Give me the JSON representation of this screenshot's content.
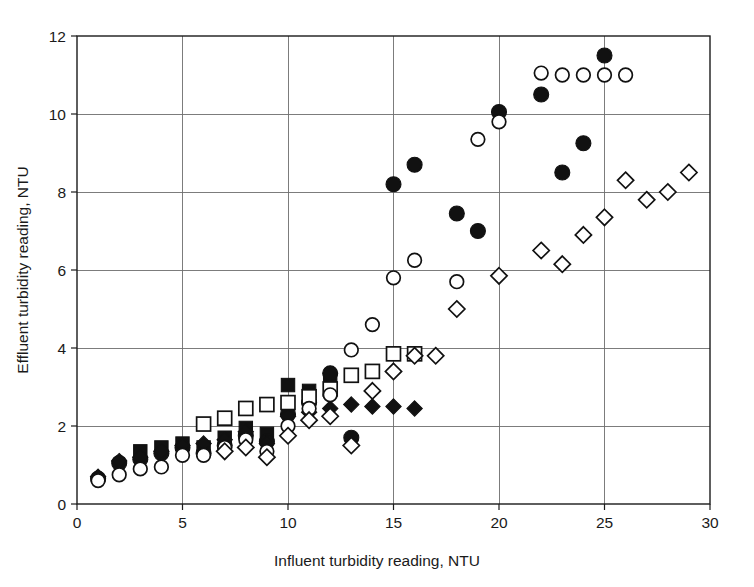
{
  "chart_data": {
    "type": "scatter",
    "title": "",
    "xlabel": "Influent turbidity reading, NTU",
    "ylabel": "Effluent turbidity reading, NTU",
    "xlim": [
      0,
      30
    ],
    "ylim": [
      0,
      12
    ],
    "xticks": [
      0,
      5,
      10,
      15,
      20,
      25,
      30
    ],
    "yticks": [
      0,
      2,
      4,
      6,
      8,
      10,
      12
    ],
    "xtick_labels": [
      "0",
      "5",
      "10",
      "15",
      "20",
      "25",
      "30"
    ],
    "ytick_labels": [
      "0",
      "2",
      "4",
      "6",
      "8",
      "10",
      "12"
    ],
    "grid": true,
    "grid_color": "#6e6e6e",
    "legend": "none",
    "marker_color": "#111111",
    "series": [
      {
        "name": "filled-circle",
        "marker": "filled-circle",
        "points": [
          [
            1,
            0.65
          ],
          [
            2,
            1.05
          ],
          [
            3,
            1.15
          ],
          [
            4,
            1.3
          ],
          [
            5,
            1.45
          ],
          [
            6,
            1.3
          ],
          [
            7,
            1.5
          ],
          [
            8,
            1.75
          ],
          [
            9,
            1.6
          ],
          [
            10,
            2.3
          ],
          [
            11,
            2.6
          ],
          [
            12,
            3.35
          ],
          [
            13,
            1.7
          ],
          [
            15,
            8.2
          ],
          [
            16,
            8.7
          ],
          [
            18,
            7.45
          ],
          [
            19,
            7.0
          ],
          [
            20,
            10.05
          ],
          [
            22,
            10.5
          ],
          [
            23,
            8.5
          ],
          [
            24,
            9.25
          ],
          [
            25,
            11.5
          ]
        ]
      },
      {
        "name": "open-circle",
        "marker": "open-circle",
        "points": [
          [
            1,
            0.6
          ],
          [
            2,
            0.75
          ],
          [
            3,
            0.9
          ],
          [
            4,
            0.95
          ],
          [
            5,
            1.25
          ],
          [
            6,
            1.25
          ],
          [
            7,
            1.45
          ],
          [
            8,
            1.65
          ],
          [
            9,
            1.35
          ],
          [
            10,
            2.0
          ],
          [
            11,
            2.45
          ],
          [
            12,
            2.8
          ],
          [
            13,
            3.95
          ],
          [
            14,
            4.6
          ],
          [
            15,
            5.8
          ],
          [
            16,
            6.25
          ],
          [
            18,
            5.7
          ],
          [
            19,
            9.35
          ],
          [
            20,
            9.8
          ],
          [
            22,
            11.05
          ],
          [
            23,
            11.0
          ],
          [
            24,
            11.0
          ],
          [
            25,
            11.0
          ],
          [
            26,
            11.0
          ]
        ]
      },
      {
        "name": "filled-square",
        "marker": "filled-square",
        "points": [
          [
            3,
            1.35
          ],
          [
            4,
            1.45
          ],
          [
            5,
            1.55
          ],
          [
            6,
            1.45
          ],
          [
            7,
            1.7
          ],
          [
            8,
            1.95
          ],
          [
            9,
            1.8
          ],
          [
            10,
            3.05
          ],
          [
            11,
            2.9
          ],
          [
            12,
            3.2
          ]
        ]
      },
      {
        "name": "open-square",
        "marker": "open-square",
        "points": [
          [
            6,
            2.05
          ],
          [
            7,
            2.2
          ],
          [
            8,
            2.45
          ],
          [
            9,
            2.55
          ],
          [
            10,
            2.6
          ],
          [
            11,
            2.75
          ],
          [
            12,
            2.95
          ],
          [
            13,
            3.3
          ],
          [
            14,
            3.4
          ],
          [
            15,
            3.85
          ],
          [
            16,
            3.85
          ]
        ]
      },
      {
        "name": "filled-diamond",
        "marker": "filled-diamond",
        "points": [
          [
            1,
            0.7
          ],
          [
            2,
            1.1
          ],
          [
            3,
            1.2
          ],
          [
            4,
            1.35
          ],
          [
            5,
            1.5
          ],
          [
            6,
            1.55
          ],
          [
            7,
            1.65
          ],
          [
            8,
            1.85
          ],
          [
            9,
            1.55
          ],
          [
            10,
            2.25
          ],
          [
            11,
            2.35
          ],
          [
            12,
            2.45
          ],
          [
            13,
            2.55
          ],
          [
            14,
            2.5
          ],
          [
            15,
            2.5
          ],
          [
            16,
            2.45
          ]
        ]
      },
      {
        "name": "open-diamond",
        "marker": "open-diamond",
        "points": [
          [
            7,
            1.35
          ],
          [
            8,
            1.45
          ],
          [
            9,
            1.2
          ],
          [
            10,
            1.75
          ],
          [
            11,
            2.15
          ],
          [
            12,
            2.25
          ],
          [
            13,
            1.5
          ],
          [
            14,
            2.9
          ],
          [
            15,
            3.4
          ],
          [
            16,
            3.8
          ],
          [
            17,
            3.8
          ],
          [
            18,
            5.0
          ],
          [
            20,
            5.85
          ],
          [
            22,
            6.5
          ],
          [
            23,
            6.15
          ],
          [
            24,
            6.9
          ],
          [
            25,
            7.35
          ],
          [
            26,
            8.3
          ],
          [
            27,
            7.8
          ],
          [
            28,
            8.0
          ],
          [
            29,
            8.5
          ]
        ]
      }
    ]
  },
  "plot_geometry": {
    "left_px": 77,
    "right_px": 710,
    "top_px": 36,
    "bottom_px": 504,
    "marker_radius": 7.5
  }
}
